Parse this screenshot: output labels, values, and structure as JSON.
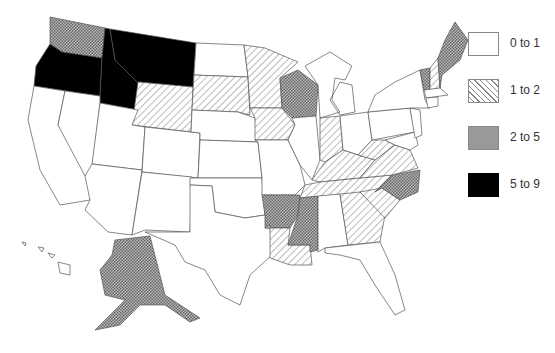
{
  "legend": {
    "items": [
      {
        "label": "0 to 1",
        "pattern": "white"
      },
      {
        "label": "1 to 2",
        "pattern": "diagonal-hatch"
      },
      {
        "label": "2 to 5",
        "pattern": "crosshatch"
      },
      {
        "label": "5 to 9",
        "pattern": "solid-black"
      }
    ]
  },
  "map": {
    "region": "United States",
    "categories": {
      "0 to 1": [
        "California",
        "Nevada",
        "Utah",
        "Arizona",
        "Colorado",
        "New Mexico",
        "Nebraska",
        "Kansas",
        "Oklahoma",
        "Texas",
        "North Dakota",
        "Missouri",
        "Illinois",
        "Michigan",
        "Ohio",
        "Pennsylvania",
        "New York",
        "New Jersey",
        "Maryland",
        "Delaware",
        "Connecticut",
        "Rhode Island",
        "Massachusetts",
        "Alabama",
        "Florida",
        "Hawaii"
      ],
      "1 to 2": [
        "Wyoming",
        "South Dakota",
        "Minnesota",
        "Iowa",
        "Indiana",
        "Kentucky",
        "Tennessee",
        "West Virginia",
        "Virginia",
        "Louisiana",
        "Georgia",
        "South Carolina",
        "New Hampshire"
      ],
      "2 to 5": [
        "Washington",
        "Wisconsin",
        "Arkansas",
        "Mississippi",
        "North Carolina",
        "Vermont",
        "Maine",
        "Alaska"
      ],
      "5 to 9": [
        "Oregon",
        "Idaho",
        "Montana"
      ]
    }
  }
}
